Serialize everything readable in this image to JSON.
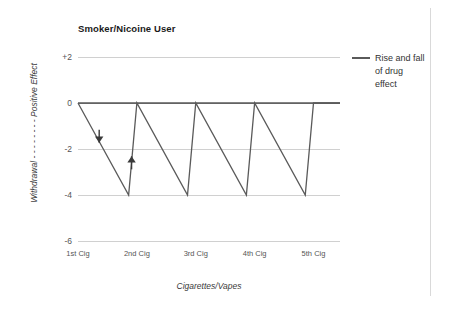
{
  "chart_data": {
    "type": "line",
    "title": "Smoker/Nicoine User",
    "xlabel": "Cigarettes/Vapes",
    "ylabel": "Withdrawal - - - - - - - -  Positive Effect",
    "ylabel_parts": {
      "low": "Withdrawal",
      "dashes": "- - - - - - - -",
      "high": "Positive Effect"
    },
    "ylim": [
      -6,
      2
    ],
    "yticks": [
      2,
      0,
      -2,
      -4,
      -6
    ],
    "ytick_labels": [
      "+2",
      "0",
      "-2",
      "-4",
      "-6"
    ],
    "grid": true,
    "legend_position": "right",
    "categories": [
      "1st Cig",
      "2nd Cig",
      "3rd Cig",
      "4th Cig",
      "5th Cig"
    ],
    "series": [
      {
        "name": "Rise and fall of drug effect",
        "color": "#5a5a5a",
        "comment": "sawtooth: each cigarette restores effect to 0, then effect decays to -4 before the next one",
        "points": [
          {
            "x": 0.0,
            "y": 0
          },
          {
            "x": 0.86,
            "y": -4
          },
          {
            "x": 1.0,
            "y": 0
          },
          {
            "x": 1.86,
            "y": -4
          },
          {
            "x": 2.0,
            "y": 0
          },
          {
            "x": 2.86,
            "y": -4
          },
          {
            "x": 3.0,
            "y": 0
          },
          {
            "x": 3.86,
            "y": -4
          },
          {
            "x": 4.0,
            "y": 0
          },
          {
            "x": 4.45,
            "y": 0
          }
        ],
        "baseline": {
          "y": 0,
          "from_x": 0.0,
          "to_x": 4.45
        }
      }
    ],
    "annotations": [
      {
        "name": "decline-arrow",
        "direction": "down",
        "x": 0.36,
        "y": -1.45,
        "label": ""
      },
      {
        "name": "rise-arrow",
        "direction": "up",
        "x": 0.91,
        "y": -2.6,
        "label": ""
      }
    ]
  },
  "legend": {
    "entries": [
      {
        "label": "Rise and fall of drug effect",
        "color": "#5a5a5a",
        "marker": "line-swatch"
      }
    ]
  },
  "colors": {
    "series": "#5a5a5a",
    "gridline": "#d0d0d0",
    "zero_line": "#808080",
    "text": "#333333",
    "background": "#ffffff",
    "border_rule": "#d9d9d9"
  }
}
